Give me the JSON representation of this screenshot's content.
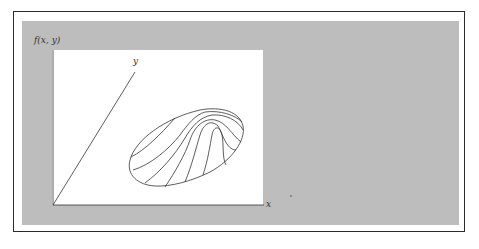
{
  "figure": {
    "function_label": "f(x, y)",
    "x_axis_label": "x",
    "y_axis_label": "y"
  },
  "colors": {
    "frame_border": "#2b2b2b",
    "background_gray": "#bdbdbd",
    "panel": "#ffffff",
    "line": "#333333"
  }
}
